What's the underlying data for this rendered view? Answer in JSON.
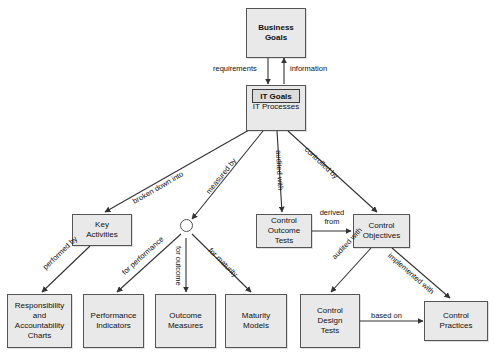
{
  "diagram": {
    "background_color": "#ffffff",
    "node_fill": "#e9e9e9",
    "node_stroke": "#555555",
    "inner_fill": "#dcdcdc",
    "inner_stroke": "#3a3a3a",
    "line_color": "#333333",
    "nodes": [
      {
        "id": "business-goals",
        "label": "Business\nGoals",
        "line1": "Business",
        "line2": "Goals",
        "bold": true
      },
      {
        "id": "it-processes",
        "label": "IT Processes",
        "inner_label": "IT Goals"
      },
      {
        "id": "key-activities",
        "line1": "Key",
        "line2": "Activities"
      },
      {
        "id": "control-outcome-tests",
        "line1": "Control",
        "line2": "Outcome",
        "line3": "Tests"
      },
      {
        "id": "control-objectives",
        "line1": "Control",
        "line2": "Objectives"
      },
      {
        "id": "responsibility-and-accountability-charts",
        "line1": "Responsibility",
        "line2": "and",
        "line3": "Accountability",
        "line4": "Charts"
      },
      {
        "id": "performance-indicators",
        "line1": "Performance",
        "line2": "Indicators"
      },
      {
        "id": "outcome-measures",
        "line1": "Outcome",
        "line2": "Measures"
      },
      {
        "id": "maturity-models",
        "line1": "Maturity",
        "line2": "Models"
      },
      {
        "id": "control-design-tests",
        "line1": "Control",
        "line2": "Design",
        "line3": "Tests"
      },
      {
        "id": "control-practices",
        "line1": "Control",
        "line2": "Practices"
      }
    ],
    "edge_labels": {
      "requirements": "requirements",
      "information": "information",
      "broken_down_into": "broken down into",
      "measured_by": "measured by",
      "audited_with_top": "audited with",
      "controlled_by": "controlled by",
      "performed_by": "performed by",
      "for_performance": "for performance",
      "for_outcome": "for outcome",
      "for_maturity": "for maturity",
      "derived_from_l1": "derived",
      "derived_from_l2": "from",
      "audited_with_bottom": "audited with",
      "implemented_with": "implemented with",
      "based_on": "based on"
    }
  }
}
